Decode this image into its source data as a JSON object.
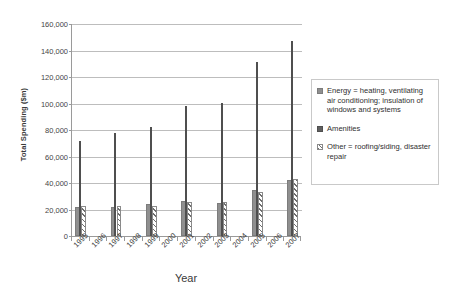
{
  "chart_data": {
    "type": "bar",
    "title": "",
    "xlabel": "Year",
    "ylabel": "Total Spending ($m)",
    "ylim": [
      0,
      160000
    ],
    "ytick_labels": [
      "160,000",
      "140,000",
      "120,000",
      "100,000",
      "80,000",
      "60,000",
      "40,000",
      "20,000",
      "0"
    ],
    "ytick_values": [
      160000,
      140000,
      120000,
      100000,
      80000,
      60000,
      40000,
      20000,
      0
    ],
    "grid": true,
    "legend_position": "right",
    "categories": [
      "1995",
      "1996",
      "1997",
      "1998",
      "1999",
      "2000",
      "2001",
      "2002",
      "2003",
      "2004",
      "2005",
      "2006",
      "2007"
    ],
    "series": [
      {
        "name": "Energy",
        "legend_label": "Energy = heating, ventilating air conditioning; insulation of windows and systems",
        "color": "#8f8f8f",
        "values": [
          22000,
          null,
          22000,
          null,
          24000,
          null,
          26500,
          null,
          25000,
          null,
          34500,
          null,
          42000
        ]
      },
      {
        "name": "Amenities",
        "legend_label": "Amenities",
        "color": "#5f5f5f",
        "values": [
          72000,
          null,
          78000,
          null,
          82000,
          null,
          98000,
          null,
          100500,
          null,
          131000,
          null,
          147000
        ]
      },
      {
        "name": "Other",
        "legend_label": "Other = roofing/siding, disaster repair",
        "color": "hatch",
        "values": [
          22500,
          null,
          22500,
          null,
          23000,
          null,
          26000,
          null,
          25500,
          null,
          33000,
          null,
          43000
        ]
      }
    ]
  },
  "legend": {
    "items": [
      {
        "label": "Energy = heating, ventilating air conditioning; insulation of windows and systems",
        "swatch": "energy"
      },
      {
        "label": "Amenities",
        "swatch": "amen"
      },
      {
        "label": "Other = roofing/siding, disaster repair",
        "swatch": "other"
      }
    ]
  }
}
